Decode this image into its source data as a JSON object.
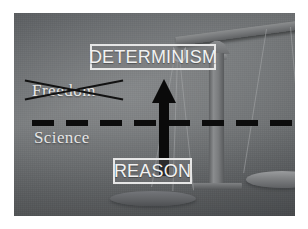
{
  "slide": {
    "title": "Determinism vs Freedom balance diagram",
    "background_color": "#6e7072",
    "frame_color": "#ffffff"
  },
  "labels": {
    "determinism": "DETERMINISM",
    "reason": "REASON",
    "science": "Science",
    "freedom_crossed_out": "Freedom"
  },
  "graphics": {
    "arrow": {
      "name": "upward-arrow",
      "color": "#0a0a0a",
      "direction": "up",
      "points_from": "REASON",
      "points_to": "DETERMINISM"
    },
    "divider": {
      "name": "dashed-divider-line",
      "color": "#0c0c0c",
      "style": "dashed",
      "orientation": "horizontal"
    },
    "cross_out": {
      "name": "x-strikeout",
      "color": "#121212",
      "over_word": "Freedom"
    },
    "scale": {
      "name": "balance-scale",
      "color": "#7a7c7e",
      "pans": [
        "left",
        "right"
      ],
      "tilt": "left side raised"
    }
  },
  "colors": {
    "label_text": "#f2f2f2",
    "label_border": "#e6e6e6",
    "arrow": "#0a0a0a",
    "dash": "#0c0c0c",
    "caption_text": "#e6e6e6"
  }
}
